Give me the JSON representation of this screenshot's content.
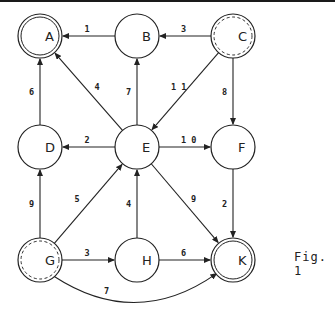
{
  "figure": {
    "caption": "Fig. 1"
  },
  "graph": {
    "nodes": [
      {
        "id": "A",
        "label": "A",
        "type": "double",
        "x": 40,
        "y": 36
      },
      {
        "id": "B",
        "label": "B",
        "type": "plain",
        "x": 137,
        "y": 36
      },
      {
        "id": "C",
        "label": "C",
        "type": "dashed",
        "x": 233,
        "y": 36
      },
      {
        "id": "D",
        "label": "D",
        "type": "plain",
        "x": 40,
        "y": 147
      },
      {
        "id": "E",
        "label": "E",
        "type": "plain",
        "x": 137,
        "y": 147
      },
      {
        "id": "F",
        "label": "F",
        "type": "plain",
        "x": 233,
        "y": 147
      },
      {
        "id": "G",
        "label": "G",
        "type": "dashed",
        "x": 40,
        "y": 260
      },
      {
        "id": "H",
        "label": "H",
        "type": "plain",
        "x": 137,
        "y": 260
      },
      {
        "id": "K",
        "label": "K",
        "type": "double",
        "x": 233,
        "y": 260
      }
    ],
    "edges": [
      {
        "from": "B",
        "to": "A",
        "weight": "1"
      },
      {
        "from": "C",
        "to": "B",
        "weight": "3"
      },
      {
        "from": "C",
        "to": "E",
        "weight": "1 1"
      },
      {
        "from": "C",
        "to": "F",
        "weight": "8"
      },
      {
        "from": "D",
        "to": "A",
        "weight": "6"
      },
      {
        "from": "E",
        "to": "A",
        "weight": "4"
      },
      {
        "from": "E",
        "to": "B",
        "weight": "7"
      },
      {
        "from": "E",
        "to": "D",
        "weight": "2"
      },
      {
        "from": "E",
        "to": "F",
        "weight": "1 0"
      },
      {
        "from": "E",
        "to": "K",
        "weight": "9"
      },
      {
        "from": "F",
        "to": "K",
        "weight": "2"
      },
      {
        "from": "G",
        "to": "D",
        "weight": "9"
      },
      {
        "from": "G",
        "to": "E",
        "weight": "5"
      },
      {
        "from": "G",
        "to": "H",
        "weight": "3"
      },
      {
        "from": "H",
        "to": "E",
        "weight": "4"
      },
      {
        "from": "H",
        "to": "K",
        "weight": "6"
      },
      {
        "from": "G",
        "to": "K",
        "weight": "7",
        "curved": true
      }
    ],
    "legend": {
      "double_circle": "terminal nodes (A, K)",
      "dashed_circle": "source nodes (C, G)"
    }
  }
}
